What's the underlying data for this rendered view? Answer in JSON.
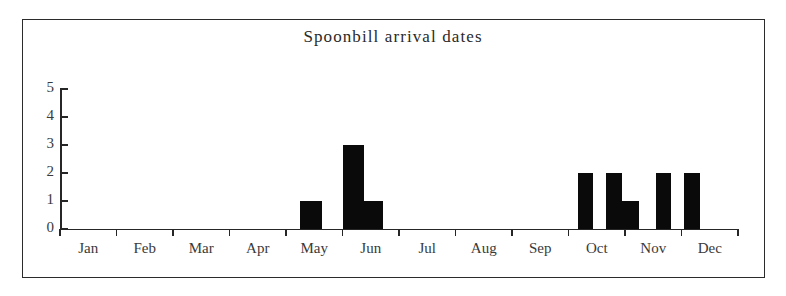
{
  "chart_data": {
    "type": "bar",
    "title": "Spoonbill arrival dates",
    "xlabel": "",
    "ylabel": "",
    "ylim": [
      0,
      5
    ],
    "yticks": [
      0,
      1,
      2,
      3,
      4,
      5
    ],
    "grid": false,
    "legend": null,
    "bar_color": "#0a0a0a",
    "axis_color": "#262626",
    "frame_color": "#2b2b2b",
    "background": "#ffffff",
    "categories": [
      "Jan",
      "Feb",
      "Mar",
      "Apr",
      "May",
      "Jun",
      "Jul",
      "Aug",
      "Sep",
      "Oct",
      "Nov",
      "Dec"
    ],
    "values": [
      0,
      0,
      0,
      0,
      4,
      1,
      0,
      0,
      0,
      5,
      4,
      0
    ],
    "note": "Bars are drawn in half-month sub-slots; see bars[] for exact placement.",
    "bars": [
      {
        "label": "May (first half)",
        "x_start_month": 4.25,
        "width_months": 0.38,
        "value": 1
      },
      {
        "label": "May (late)",
        "x_start_month": 5.0,
        "width_months": 0.38,
        "value": 3
      },
      {
        "label": "Jun (early)",
        "x_start_month": 5.38,
        "width_months": 0.33,
        "value": 1
      },
      {
        "label": "Sep (late)",
        "x_start_month": 9.17,
        "width_months": 0.27,
        "value": 2
      },
      {
        "label": "Oct (early)",
        "x_start_month": 9.67,
        "width_months": 0.27,
        "value": 2
      },
      {
        "label": "Oct (mid)",
        "x_start_month": 9.94,
        "width_months": 0.3,
        "value": 1
      },
      {
        "label": "Oct (late)",
        "x_start_month": 10.55,
        "width_months": 0.27,
        "value": 2
      },
      {
        "label": "Nov (mid)",
        "x_start_month": 11.05,
        "width_months": 0.27,
        "value": 2
      }
    ]
  },
  "chart": {
    "title": "Spoonbill arrival dates",
    "y_axis": {
      "labels": [
        "5",
        "4",
        "3",
        "2",
        "1",
        "0"
      ],
      "values": [
        5,
        4,
        3,
        2,
        1,
        0
      ]
    },
    "x_axis": {
      "labels": [
        "Jan",
        "Feb",
        "Mar",
        "Apr",
        "May",
        "Jun",
        "Jul",
        "Aug",
        "Sep",
        "Oct",
        "Nov",
        "Dec"
      ],
      "tick_count": 13
    }
  }
}
